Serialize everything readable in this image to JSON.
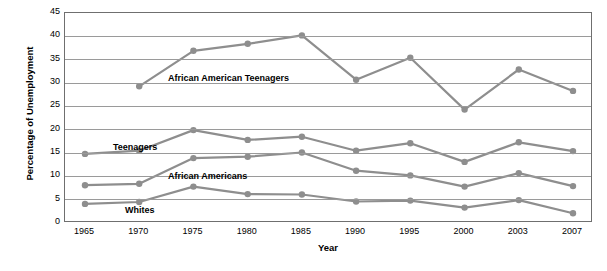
{
  "chart_data": {
    "type": "line",
    "title": "",
    "xlabel": "Year",
    "ylabel": "Percentage of Unemployment",
    "categories": [
      "1965",
      "1970",
      "1975",
      "1980",
      "1985",
      "1990",
      "1995",
      "2000",
      "2003",
      "2007"
    ],
    "yticks": [
      0,
      5,
      10,
      15,
      20,
      25,
      30,
      35,
      40,
      45
    ],
    "ylim": [
      0,
      45
    ],
    "grid": "horizontal",
    "legend_position": "inline-annotations",
    "line_color": "#8e8e8e",
    "marker_color": "#8e8e8e",
    "series": [
      {
        "name": "African American Teenagers",
        "label_x": 1975,
        "values": [
          null,
          29.3,
          36.9,
          38.4,
          40.2,
          30.7,
          35.4,
          24.3,
          32.9,
          28.3
        ]
      },
      {
        "name": "Teenagers",
        "label_x": 1970,
        "values": [
          14.8,
          15.5,
          19.9,
          17.8,
          18.5,
          15.5,
          17.1,
          13.1,
          17.3,
          15.4
        ]
      },
      {
        "name": "African Americans",
        "label_x": 1975,
        "values": [
          8.1,
          8.4,
          13.9,
          14.2,
          15.1,
          11.2,
          10.2,
          7.8,
          10.7,
          7.9
        ]
      },
      {
        "name": "Whites",
        "label_x": 1972,
        "values": [
          4.1,
          4.5,
          7.8,
          6.2,
          6.1,
          4.6,
          4.8,
          3.3,
          4.9,
          2.1
        ]
      }
    ]
  }
}
